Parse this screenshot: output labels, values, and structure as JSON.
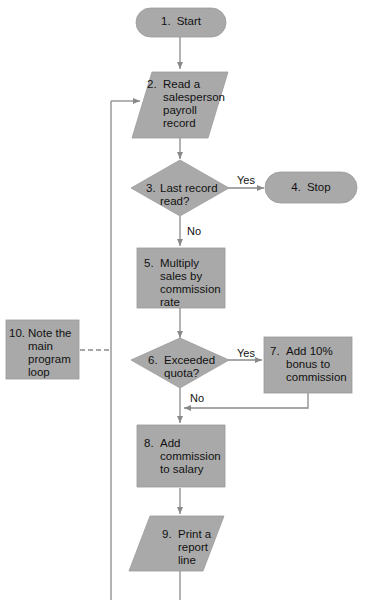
{
  "colors": {
    "fill": "#a9a9a9",
    "stroke": "#8f8f8f",
    "line": "#8a8a8a",
    "text": "#111111",
    "background": "#ffffff"
  },
  "nodes": [
    {
      "id": 1,
      "num": "1.",
      "text": "Start",
      "shape": "terminal"
    },
    {
      "id": 2,
      "num": "2.",
      "text": "Read a salesperson payroll record",
      "shape": "input-output"
    },
    {
      "id": 3,
      "num": "3.",
      "text": "Last record read?",
      "shape": "decision"
    },
    {
      "id": 4,
      "num": "4.",
      "text": "Stop",
      "shape": "terminal"
    },
    {
      "id": 5,
      "num": "5.",
      "text": "Multiply sales by commission rate",
      "shape": "process"
    },
    {
      "id": 6,
      "num": "6.",
      "text": "Exceeded quota?",
      "shape": "decision"
    },
    {
      "id": 7,
      "num": "7.",
      "text": "Add 10% bonus to commission",
      "shape": "process"
    },
    {
      "id": 8,
      "num": "8.",
      "text": "Add commission to salary",
      "shape": "process"
    },
    {
      "id": 9,
      "num": "9.",
      "text": "Print a report line",
      "shape": "input-output"
    },
    {
      "id": 10,
      "num": "10.",
      "text": "Note the main program loop",
      "shape": "annotation"
    }
  ],
  "edge_labels": {
    "yes_3": "Yes",
    "no_3": "No",
    "yes_6": "Yes",
    "no_6": "No"
  }
}
